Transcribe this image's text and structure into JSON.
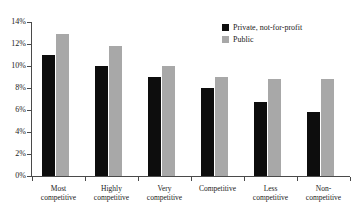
{
  "chart_data": {
    "type": "bar",
    "title": "",
    "subtitle": "",
    "xlabel": "",
    "ylabel": "",
    "ylim": [
      0,
      14
    ],
    "ytick_labels": [
      "0%",
      "2%",
      "4%",
      "6%",
      "8%",
      "10%",
      "12%",
      "14%"
    ],
    "ytick_values": [
      0,
      2,
      4,
      6,
      8,
      10,
      12,
      14
    ],
    "grid": false,
    "legend_position": "top-right",
    "categories": [
      "Most competitive",
      "Highly competitive",
      "Very competitive",
      "Competitive",
      "Less competitive",
      "Non-competitive"
    ],
    "category_lines": [
      [
        "Most",
        "competitive"
      ],
      [
        "Highly",
        "competitive"
      ],
      [
        "Very",
        "competitive"
      ],
      [
        "Competitive"
      ],
      [
        "Less",
        "competitive"
      ],
      [
        "Non-",
        "competitive"
      ]
    ],
    "series": [
      {
        "name": "Private, not-for-profit",
        "color": "#0d0d0d",
        "values": [
          11.0,
          10.0,
          9.0,
          8.0,
          6.7,
          5.8
        ]
      },
      {
        "name": "Public",
        "color": "#a8a8a8",
        "values": [
          12.9,
          11.8,
          10.0,
          9.0,
          8.8,
          8.8
        ]
      }
    ]
  },
  "legend": {
    "items": [
      {
        "label": "Private, not-for-profit",
        "swatch": "private"
      },
      {
        "label": "Public",
        "swatch": "public"
      }
    ]
  }
}
